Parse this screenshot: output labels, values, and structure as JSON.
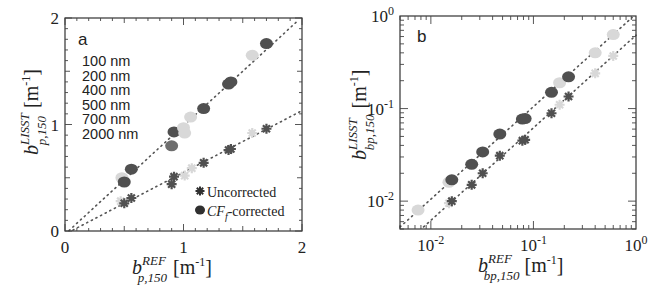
{
  "chart_data": [
    {
      "panel": "a",
      "type": "scatter",
      "xscale": "linear",
      "yscale": "linear",
      "xlim": [
        0,
        2
      ],
      "ylim": [
        0,
        2
      ],
      "xticks": [
        0,
        1,
        2
      ],
      "yticks": [
        0,
        1,
        2
      ],
      "xtick_labels": [
        "0",
        "1",
        "2"
      ],
      "ytick_labels": [
        "0",
        "1",
        "2"
      ],
      "xlabel": {
        "base": "b",
        "sup": "REF",
        "sub": "p,150",
        "unit": "[m",
        "unit_exp": "-1",
        "unit_close": "]"
      },
      "ylabel": {
        "base": "b",
        "sup": "LISST",
        "sub": "p,150",
        "unit": "[m",
        "unit_exp": "-1",
        "unit_close": "]"
      },
      "size_legend": [
        "100 nm",
        "200 nm",
        "400 nm",
        "500 nm",
        "700 nm",
        "2000 nm"
      ],
      "marker_legend": [
        {
          "marker": "star",
          "label": "Uncorrected"
        },
        {
          "marker": "circle",
          "label_italic": "CF",
          "label_sub": "f",
          "label_rest": "-corrected"
        }
      ],
      "grid": false,
      "fit_lines": [
        {
          "name": "corrected-fit",
          "slope": 1.02,
          "intercept": -0.03
        },
        {
          "name": "uncorrected-fit",
          "slope": 0.58,
          "intercept": -0.03
        }
      ],
      "series": [
        {
          "name": "CFf-corrected",
          "marker": "circle",
          "points": [
            {
              "x": 0.48,
              "y": 0.5,
              "shade": "light"
            },
            {
              "x": 0.5,
              "y": 0.46,
              "shade": "dark"
            },
            {
              "x": 0.56,
              "y": 0.58,
              "shade": "dark"
            },
            {
              "x": 0.9,
              "y": 0.8,
              "shade": "mid"
            },
            {
              "x": 0.92,
              "y": 0.93,
              "shade": "dark"
            },
            {
              "x": 1.0,
              "y": 0.97,
              "shade": "light"
            },
            {
              "x": 1.01,
              "y": 0.92,
              "shade": "light"
            },
            {
              "x": 1.06,
              "y": 1.07,
              "shade": "light"
            },
            {
              "x": 1.17,
              "y": 1.15,
              "shade": "dark"
            },
            {
              "x": 1.38,
              "y": 1.38,
              "shade": "dark"
            },
            {
              "x": 1.4,
              "y": 1.4,
              "shade": "dark"
            },
            {
              "x": 1.58,
              "y": 1.65,
              "shade": "light"
            },
            {
              "x": 1.7,
              "y": 1.76,
              "shade": "dark"
            }
          ]
        },
        {
          "name": "Uncorrected",
          "marker": "star",
          "points": [
            {
              "x": 0.47,
              "y": 0.28,
              "shade": "light"
            },
            {
              "x": 0.5,
              "y": 0.26,
              "shade": "dark"
            },
            {
              "x": 0.56,
              "y": 0.31,
              "shade": "dark"
            },
            {
              "x": 0.9,
              "y": 0.44,
              "shade": "dark"
            },
            {
              "x": 0.92,
              "y": 0.51,
              "shade": "dark"
            },
            {
              "x": 1.01,
              "y": 0.52,
              "shade": "light"
            },
            {
              "x": 1.07,
              "y": 0.59,
              "shade": "light"
            },
            {
              "x": 1.17,
              "y": 0.64,
              "shade": "dark"
            },
            {
              "x": 1.38,
              "y": 0.76,
              "shade": "dark"
            },
            {
              "x": 1.4,
              "y": 0.77,
              "shade": "dark"
            },
            {
              "x": 1.58,
              "y": 0.92,
              "shade": "light"
            },
            {
              "x": 1.7,
              "y": 0.96,
              "shade": "dark"
            }
          ]
        }
      ]
    },
    {
      "panel": "b",
      "type": "scatter",
      "xscale": "log",
      "yscale": "log",
      "xlim": [
        0.005,
        1
      ],
      "ylim": [
        0.005,
        1
      ],
      "xticks": [
        0.01,
        0.1,
        1
      ],
      "yticks": [
        0.01,
        0.1,
        1
      ],
      "xtick_labels": [
        {
          "base": "10",
          "exp": "-2"
        },
        {
          "base": "10",
          "exp": "-1"
        },
        {
          "base": "10",
          "exp": "0"
        }
      ],
      "ytick_labels": [
        {
          "base": "10",
          "exp": "-2"
        },
        {
          "base": "10",
          "exp": "-1"
        },
        {
          "base": "10",
          "exp": "0"
        }
      ],
      "xlabel": {
        "base": "b",
        "sup": "REF",
        "sub": "bp,150",
        "unit": "[m",
        "unit_exp": "-1",
        "unit_close": "]"
      },
      "ylabel": {
        "base": "b",
        "sup": "LISST",
        "sub": "bp,150",
        "unit": "[m",
        "unit_exp": "-1",
        "unit_close": "]"
      },
      "grid": false,
      "fit_lines": [
        {
          "name": "corrected-fit",
          "factor": 1.05
        },
        {
          "name": "uncorrected-fit",
          "factor": 0.62
        }
      ],
      "series": [
        {
          "name": "CFf-corrected",
          "marker": "circle",
          "points": [
            {
              "x": 0.0075,
              "y": 0.008,
              "shade": "light"
            },
            {
              "x": 0.015,
              "y": 0.016,
              "shade": "light"
            },
            {
              "x": 0.016,
              "y": 0.017,
              "shade": "dark"
            },
            {
              "x": 0.025,
              "y": 0.025,
              "shade": "dark"
            },
            {
              "x": 0.032,
              "y": 0.034,
              "shade": "dark"
            },
            {
              "x": 0.047,
              "y": 0.053,
              "shade": "dark"
            },
            {
              "x": 0.078,
              "y": 0.077,
              "shade": "dark"
            },
            {
              "x": 0.083,
              "y": 0.078,
              "shade": "dark"
            },
            {
              "x": 0.15,
              "y": 0.15,
              "shade": "dark"
            },
            {
              "x": 0.18,
              "y": 0.19,
              "shade": "light"
            },
            {
              "x": 0.22,
              "y": 0.22,
              "shade": "dark"
            },
            {
              "x": 0.4,
              "y": 0.4,
              "shade": "light"
            },
            {
              "x": 0.6,
              "y": 0.63,
              "shade": "light"
            }
          ]
        },
        {
          "name": "Uncorrected",
          "marker": "star",
          "points": [
            {
              "x": 0.015,
              "y": 0.0095,
              "shade": "light"
            },
            {
              "x": 0.016,
              "y": 0.01,
              "shade": "dark"
            },
            {
              "x": 0.025,
              "y": 0.015,
              "shade": "dark"
            },
            {
              "x": 0.032,
              "y": 0.02,
              "shade": "dark"
            },
            {
              "x": 0.047,
              "y": 0.031,
              "shade": "dark"
            },
            {
              "x": 0.078,
              "y": 0.045,
              "shade": "dark"
            },
            {
              "x": 0.083,
              "y": 0.046,
              "shade": "dark"
            },
            {
              "x": 0.15,
              "y": 0.089,
              "shade": "dark"
            },
            {
              "x": 0.18,
              "y": 0.11,
              "shade": "light"
            },
            {
              "x": 0.22,
              "y": 0.135,
              "shade": "dark"
            },
            {
              "x": 0.4,
              "y": 0.24,
              "shade": "light"
            },
            {
              "x": 0.6,
              "y": 0.37,
              "shade": "light"
            }
          ]
        }
      ]
    }
  ],
  "colors": {
    "dark": "#505050",
    "mid": "#6e6e6e",
    "light": "#d8d8d8",
    "axis": "#333333",
    "fit_line": "#555555"
  }
}
